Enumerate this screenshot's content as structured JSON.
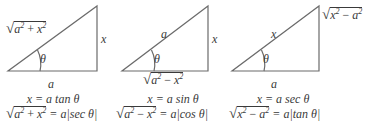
{
  "colors": {
    "line": "#6b6b6b",
    "text": "#3a3a3a",
    "background": "#ffffff"
  },
  "triangles": [
    {
      "hypotenuse": {
        "radicand_a": "a",
        "op": "+",
        "radicand_b": "x",
        "exp": "2"
      },
      "opposite": "x",
      "adjacent": "a",
      "angle": "θ",
      "substitution": "x = a tan θ",
      "identity": {
        "radicand_left": "a",
        "op": "+",
        "radicand_right": "x",
        "exp": "2",
        "rhs": "= a|sec θ|"
      }
    },
    {
      "hypotenuse": "a",
      "opposite": "x",
      "adjacent": {
        "radicand_a": "a",
        "op": "−",
        "radicand_b": "x",
        "exp": "2"
      },
      "angle": "θ",
      "substitution": "x = a sin θ",
      "identity": {
        "radicand_left": "a",
        "op": "−",
        "radicand_right": "x",
        "exp": "2",
        "rhs": "= a|cos θ|"
      }
    },
    {
      "hypotenuse": "x",
      "opposite": {
        "radicand_a": "x",
        "op": "−",
        "radicand_b": "a",
        "exp": "2"
      },
      "adjacent": "a",
      "angle": "θ",
      "substitution": "x = a sec θ",
      "identity": {
        "radicand_left": "x",
        "op": "−",
        "radicand_right": "a",
        "exp": "2",
        "rhs": "= a|tan θ|"
      }
    }
  ]
}
